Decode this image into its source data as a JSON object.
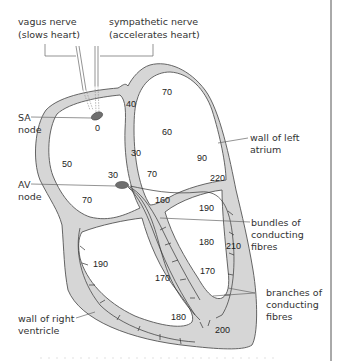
{
  "labels": {
    "vagus_nerve": [
      "vagus nerve",
      "(slows heart)"
    ],
    "sympathetic_nerve": [
      "sympathetic nerve",
      "(accelerates heart)"
    ],
    "sa_node": [
      "SA",
      "node"
    ],
    "av_node": [
      "AV",
      "node"
    ],
    "wall_left_atrium": [
      "wall of left",
      "atrium"
    ],
    "bundles": [
      "bundles of",
      "conducting",
      "fibres"
    ],
    "branches": [
      "branches of",
      "conducting",
      "fibres"
    ],
    "wall_right_ventricle": [
      "wall of right",
      "ventricle"
    ]
  },
  "times_ms": {
    "sa": "0",
    "right_atrium_upper": "40",
    "left_atrium_top": "70",
    "left_atrium_mid": "60",
    "septum_atrial": "30",
    "left_atrium_lower": "90",
    "right_atrium_mid": "50",
    "av_top": "30",
    "atrial_floor_left": "70",
    "atrial_floor_right": "70",
    "av_below": "160",
    "left_ventricle_top": "220",
    "left_ventricle_upper": "190",
    "left_ventricle_mid": "180",
    "left_ventricle_wall": "210",
    "right_ventricle": "190",
    "septum_lower": "170",
    "left_ventricle_inner": "170",
    "right_ventricle_floor": "180",
    "apex": "200"
  }
}
